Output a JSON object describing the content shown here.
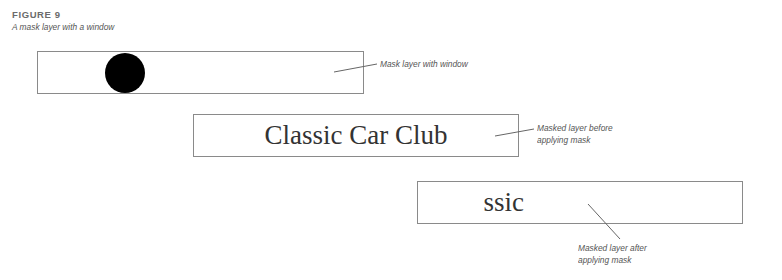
{
  "figure": {
    "number": "FIGURE 9",
    "caption": "A mask layer with a window"
  },
  "panels": [
    {
      "id": "mask-layer",
      "content": "black-circle-window",
      "label_lines": [
        "Mask layer with window"
      ]
    },
    {
      "id": "masked-layer-before",
      "content": "Classic Car Club",
      "label_lines": [
        "Masked layer before",
        "applying mask"
      ]
    },
    {
      "id": "masked-layer-after",
      "content": "'las",
      "label_lines": [
        "Masked layer after",
        "applying mask"
      ]
    }
  ],
  "colors": {
    "border": "#8a8a8a",
    "text": "#333333",
    "label": "#555555",
    "window": "#000000"
  }
}
